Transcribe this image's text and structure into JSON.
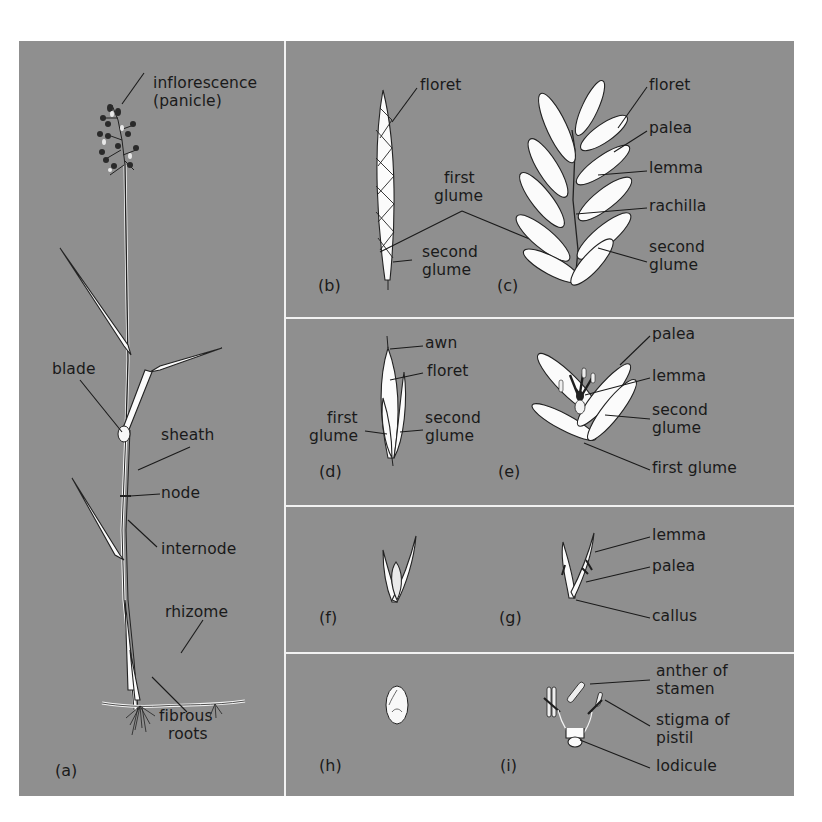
{
  "figure": {
    "background_color": "#8f8f8f",
    "divider_color": "#f2f2f2",
    "panels": {
      "a": {
        "id_label": "(a)",
        "labels": {
          "inflorescence": "inflorescence",
          "panicle": "(panicle)",
          "blade": "blade",
          "sheath": "sheath",
          "node": "node",
          "internode": "internode",
          "rhizome": "rhizome",
          "fibrous": "fibrous",
          "roots": "roots"
        }
      },
      "b": {
        "id_label": "(b)",
        "labels": {
          "floret": "floret",
          "first": "first",
          "glume": "glume",
          "second": "second",
          "glume2": "glume"
        }
      },
      "c": {
        "id_label": "(c)",
        "labels": {
          "floret": "floret",
          "palea": "palea",
          "lemma": "lemma",
          "rachilla": "rachilla",
          "second": "second",
          "glume": "glume"
        }
      },
      "d": {
        "id_label": "(d)",
        "labels": {
          "awn": "awn",
          "floret": "floret",
          "first": "first",
          "glume": "glume",
          "second": "second",
          "glume2": "glume"
        }
      },
      "e": {
        "id_label": "(e)",
        "labels": {
          "palea": "palea",
          "lemma": "lemma",
          "second": "second",
          "glume": "glume",
          "first_glume": "first glume"
        }
      },
      "f": {
        "id_label": "(f)"
      },
      "g": {
        "id_label": "(g)",
        "labels": {
          "lemma": "lemma",
          "palea": "palea",
          "callus": "callus"
        }
      },
      "h": {
        "id_label": "(h)"
      },
      "i": {
        "id_label": "(i)",
        "labels": {
          "anther_of": "anther of",
          "stamen": "stamen",
          "stigma_of": "stigma of",
          "pistil": "pistil",
          "lodicule": "lodicule"
        }
      }
    }
  }
}
